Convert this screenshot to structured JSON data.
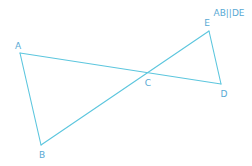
{
  "diagram": {
    "type": "geometry",
    "note": "AB||DE",
    "colors": {
      "line": "#5cc6de",
      "label": "#58a9d4",
      "background": "#ffffff"
    },
    "points": [
      {
        "id": "A",
        "label": "A",
        "x": 20,
        "y": 53,
        "label_x": 18,
        "label_y": 46
      },
      {
        "id": "B",
        "label": "B",
        "x": 41,
        "y": 145,
        "label_x": 42,
        "label_y": 155
      },
      {
        "id": "C",
        "label": "C",
        "x": 147,
        "y": 72,
        "label_x": 148,
        "label_y": 83
      },
      {
        "id": "D",
        "label": "D",
        "x": 221,
        "y": 84,
        "label_x": 224,
        "label_y": 94
      },
      {
        "id": "E",
        "label": "E",
        "x": 209,
        "y": 31,
        "label_x": 207,
        "label_y": 23
      }
    ],
    "segments": [
      {
        "from": "A",
        "to": "D",
        "through": "C"
      },
      {
        "from": "A",
        "to": "B"
      },
      {
        "from": "B",
        "to": "E",
        "through": "C"
      },
      {
        "from": "E",
        "to": "D"
      }
    ],
    "relations": [
      "AB parallel to DE",
      "AD and BE intersect at C"
    ]
  }
}
